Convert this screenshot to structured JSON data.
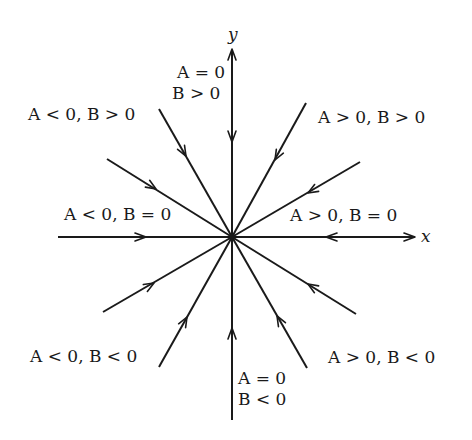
{
  "diagram": {
    "type": "phase-portrait",
    "center": {
      "x": 232,
      "y": 237
    },
    "axes": {
      "x_label": "x",
      "y_label": "y"
    },
    "region_labels": [
      {
        "id": "a0-bpos-line1",
        "text": "A = 0",
        "x": 200,
        "y": 78
      },
      {
        "id": "a0-bpos-line2",
        "text": "B > 0",
        "x": 197,
        "y": 98
      },
      {
        "id": "aneg-bpos",
        "text": "A < 0, B > 0",
        "x": 28,
        "y": 118
      },
      {
        "id": "apos-bpos",
        "text": "A > 0, B > 0",
        "x": 318,
        "y": 122
      },
      {
        "id": "aneg-b0",
        "text": "A < 0, B = 0",
        "x": 64,
        "y": 220
      },
      {
        "id": "apos-b0",
        "text": "A > 0, B = 0",
        "x": 290,
        "y": 220
      },
      {
        "id": "aneg-bneg",
        "text": "A < 0, B < 0",
        "x": 30,
        "y": 361
      },
      {
        "id": "apos-bneg",
        "text": "A > 0, B < 0",
        "x": 328,
        "y": 362
      },
      {
        "id": "a0-bneg-line1",
        "text": "A = 0",
        "x": 238,
        "y": 383
      },
      {
        "id": "a0-bneg-line2",
        "text": "B < 0",
        "x": 238,
        "y": 405
      }
    ],
    "trajectories": [
      {
        "name": "positive-y-axis",
        "from": [
          232,
          52
        ],
        "arrow_at": [
          232,
          140
        ]
      },
      {
        "name": "negative-y-axis",
        "from": [
          232,
          420
        ],
        "arrow_at": [
          232,
          330
        ]
      },
      {
        "name": "negative-x-axis",
        "from": [
          58,
          237
        ],
        "arrow_at": [
          144,
          237
        ]
      },
      {
        "name": "positive-x-axis",
        "from": [
          413,
          237
        ],
        "arrow_at": [
          328,
          237
        ]
      },
      {
        "name": "upper-left-steep",
        "from": [
          159,
          109
        ],
        "arrow_at": [
          185,
          155
        ]
      },
      {
        "name": "upper-left-shallow",
        "from": [
          107,
          159
        ],
        "arrow_at": [
          155,
          189
        ]
      },
      {
        "name": "upper-right-steep",
        "from": [
          306,
          103
        ],
        "arrow_at": [
          276,
          158
        ]
      },
      {
        "name": "upper-right-shallow",
        "from": [
          360,
          162
        ],
        "arrow_at": [
          310,
          192
        ]
      },
      {
        "name": "lower-left-shallow",
        "from": [
          103,
          312
        ],
        "arrow_at": [
          152,
          284
        ]
      },
      {
        "name": "lower-left-steep",
        "from": [
          159,
          367
        ],
        "arrow_at": [
          186,
          318
        ]
      },
      {
        "name": "lower-right-shallow",
        "from": [
          356,
          314
        ],
        "arrow_at": [
          310,
          286
        ]
      },
      {
        "name": "lower-right-steep",
        "from": [
          307,
          368
        ],
        "arrow_at": [
          278,
          318
        ]
      }
    ],
    "colors": {
      "ink": "#1a1a1a",
      "background": "#ffffff"
    }
  }
}
